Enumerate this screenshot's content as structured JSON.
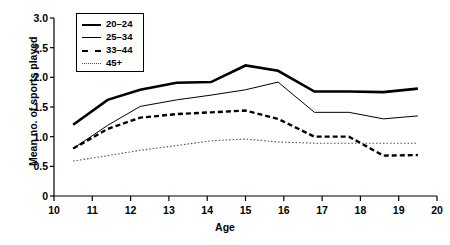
{
  "chart_data": {
    "type": "line",
    "title": "",
    "xlabel": "Age",
    "ylabel": "Mean no. of sports played",
    "xlim": [
      10,
      20
    ],
    "ylim": [
      0,
      3.0
    ],
    "xticks": [
      "10",
      "11",
      "12",
      "13",
      "14",
      "15",
      "16",
      "17",
      "18",
      "19",
      "20"
    ],
    "yticks": [
      "0",
      "0.5",
      "1.0",
      "1.5",
      "2.0",
      "2.5",
      "3.0"
    ],
    "grid": false,
    "legend_position": "top-left",
    "x": [
      10.5,
      11.4,
      12.25,
      13.2,
      14.1,
      15.0,
      15.85,
      16.8,
      17.7,
      18.6,
      19.5
    ],
    "series": [
      {
        "name": "20–24",
        "style": "solid-thick",
        "color": "#000000",
        "values": [
          1.2,
          1.62,
          1.79,
          1.91,
          1.92,
          2.2,
          2.11,
          1.76,
          1.76,
          1.75,
          1.81
        ]
      },
      {
        "name": "25–34",
        "style": "solid-thin",
        "color": "#000000",
        "values": [
          0.8,
          1.19,
          1.51,
          1.62,
          1.7,
          1.79,
          1.92,
          1.41,
          1.41,
          1.3,
          1.35
        ]
      },
      {
        "name": "33–44",
        "style": "dashed",
        "color": "#000000",
        "values": [
          0.8,
          1.13,
          1.32,
          1.38,
          1.41,
          1.44,
          1.3,
          1.0,
          1.0,
          0.68,
          0.69
        ]
      },
      {
        "name": "45+",
        "style": "dotted",
        "color": "#555555",
        "values": [
          0.59,
          0.68,
          0.77,
          0.85,
          0.93,
          0.96,
          0.91,
          0.89,
          0.89,
          0.89,
          0.89
        ]
      }
    ]
  },
  "axes": {
    "x_title": "Age",
    "y_title": "Mean no. of sports played"
  }
}
